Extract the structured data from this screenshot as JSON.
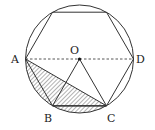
{
  "diagram": {
    "labels": {
      "A": "A",
      "B": "B",
      "C": "C",
      "D": "D",
      "O": "O"
    },
    "stroke_color": "#333333",
    "hatch_color": "#555555",
    "background": "#ffffff"
  }
}
